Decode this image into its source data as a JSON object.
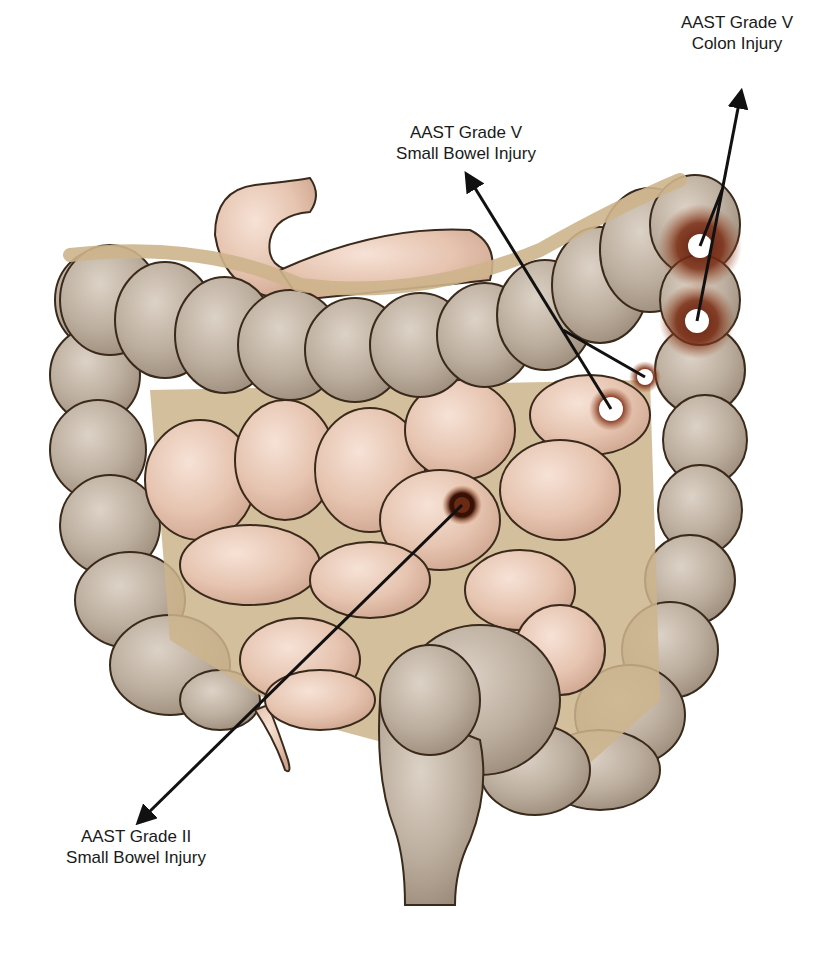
{
  "figure": {
    "colors": {
      "background": "#ffffff",
      "colon": "#b8a898",
      "colon_highlight": "#d4c8bc",
      "small_bowel": "#e8c6b4",
      "small_bowel_highlight": "#f3dccf",
      "mesentery": "#cdb48c",
      "outline": "#3a2a1c",
      "injury_bruise": "#7a2a12",
      "arrow": "#111111"
    }
  },
  "annotations": [
    {
      "id": "colon-grade-v",
      "line1": "AAST Grade V",
      "line2": "Colon Injury",
      "label_x": 737,
      "label_y": 16,
      "arrow_tip": [
        740,
        98
      ],
      "targets": [
        [
          700,
          246
        ],
        [
          697,
          321
        ]
      ]
    },
    {
      "id": "small-bowel-grade-v",
      "line1": "AAST Grade V",
      "line2": "Small Bowel Injury",
      "label_x": 466,
      "label_y": 127,
      "arrow_tip": [
        470,
        180
      ],
      "targets": [
        [
          611,
          409
        ],
        [
          645,
          377
        ]
      ]
    },
    {
      "id": "small-bowel-grade-ii",
      "line1": "AAST Grade II",
      "line2": "Small Bowel Injury",
      "label_x": 136,
      "label_y": 830,
      "arrow_tip": [
        143,
        818
      ],
      "targets": [
        [
          462,
          505
        ]
      ]
    }
  ],
  "injuries": [
    {
      "site": "splenic-flexure-upper",
      "x": 700,
      "y": 246,
      "r": 12,
      "bruise_r": 42
    },
    {
      "site": "splenic-flexure-lower",
      "x": 697,
      "y": 321,
      "r": 12,
      "bruise_r": 38
    },
    {
      "site": "jejunum-upper",
      "x": 645,
      "y": 377,
      "r": 8,
      "bruise_r": 16
    },
    {
      "site": "jejunum-lower",
      "x": 611,
      "y": 409,
      "r": 12,
      "bruise_r": 22
    },
    {
      "site": "mid-small-bowel",
      "x": 462,
      "y": 505,
      "r": 14,
      "bruise_r": 20,
      "type": "contusion"
    }
  ]
}
